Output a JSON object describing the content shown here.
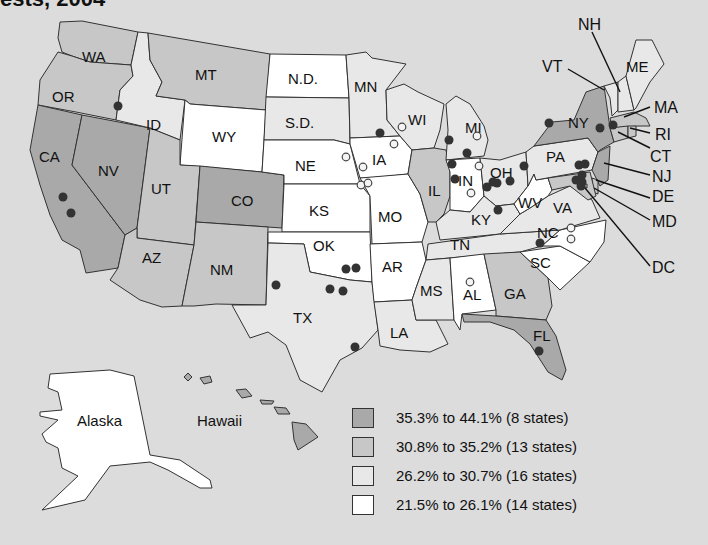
{
  "title": "ests, 2004",
  "colors": {
    "background": "#dcdcdc",
    "bin1": "#a9a9a9",
    "bin2": "#c7c7c7",
    "bin3": "#e8e8e8",
    "bin4": "#ffffff",
    "outline": "#333333"
  },
  "legend": {
    "items": [
      {
        "label": "35.3% to 44.1% (8 states)",
        "bin": "bin1"
      },
      {
        "label": "30.8% to 35.2% (13 states)",
        "bin": "bin2"
      },
      {
        "label": "26.2% to 30.7% (16 states)",
        "bin": "bin3"
      },
      {
        "label": "21.5% to 26.1% (14 states)",
        "bin": "bin4"
      }
    ]
  },
  "inset_labels": {
    "alaska": "Alaska",
    "hawaii": "Hawaii"
  },
  "states": {
    "bin1": [
      "CA",
      "NV",
      "CO",
      "NY",
      "FL",
      "NJ",
      "HI",
      "DC"
    ],
    "bin2": [
      "WA",
      "OR",
      "MT",
      "UT",
      "AZ",
      "NM",
      "IL",
      "GA",
      "MA",
      "CT",
      "RI",
      "MD",
      "DE"
    ],
    "bin3": [
      "ID",
      "S.D.",
      "MN",
      "WI",
      "MI",
      "OH",
      "TX",
      "LA",
      "MS",
      "TN",
      "KY",
      "VA",
      "NH",
      "ME",
      "VT",
      "PA"
    ],
    "bin4": [
      "WY",
      "N.D.",
      "NE",
      "KS",
      "IA",
      "MO",
      "OK",
      "AR",
      "IN",
      "WV",
      "AL",
      "NC",
      "SC",
      "AK"
    ]
  },
  "labels": {
    "WA": "WA",
    "OR": "OR",
    "CA": "CA",
    "NV": "NV",
    "ID": "ID",
    "MT": "MT",
    "WY": "WY",
    "UT": "UT",
    "CO": "CO",
    "AZ": "AZ",
    "NM": "NM",
    "ND": "N.D.",
    "SD": "S.D.",
    "NE": "NE",
    "KS": "KS",
    "OK": "OK",
    "TX": "TX",
    "MN": "MN",
    "IA": "IA",
    "MO": "MO",
    "AR": "AR",
    "LA": "LA",
    "WI": "WI",
    "IL": "IL",
    "MI": "MI",
    "IN": "IN",
    "OH": "OH",
    "KY": "KY",
    "TN": "TN",
    "MS": "MS",
    "AL": "AL",
    "GA": "GA",
    "FL": "FL",
    "SC": "SC",
    "NC": "NC",
    "VA": "VA",
    "WV": "WV",
    "PA": "PA",
    "NY": "NY",
    "VT": "VT",
    "NH": "NH",
    "ME": "ME",
    "MA": "MA",
    "RI": "RI",
    "CT": "CT",
    "NJ": "NJ",
    "DE": "DE",
    "MD": "MD",
    "DC": "DC"
  },
  "markers": {
    "filled": [
      [
        118,
        106
      ],
      [
        63,
        197
      ],
      [
        71,
        213
      ],
      [
        380,
        133
      ],
      [
        346,
        269
      ],
      [
        343,
        291
      ],
      [
        330,
        289
      ],
      [
        356,
        268
      ],
      [
        276,
        285
      ],
      [
        355,
        347
      ],
      [
        449,
        140
      ],
      [
        467,
        153
      ],
      [
        452,
        164
      ],
      [
        455,
        179
      ],
      [
        487,
        187
      ],
      [
        493,
        182
      ],
      [
        497,
        183
      ],
      [
        510,
        181
      ],
      [
        524,
        166
      ],
      [
        498,
        210
      ],
      [
        549,
        123
      ],
      [
        600,
        128
      ],
      [
        613,
        125
      ],
      [
        579,
        165
      ],
      [
        585,
        164
      ],
      [
        576,
        180
      ],
      [
        582,
        182
      ],
      [
        582,
        175
      ],
      [
        581,
        186
      ],
      [
        540,
        243
      ],
      [
        539,
        351
      ]
    ],
    "open": [
      [
        477,
        136
      ],
      [
        479,
        166
      ],
      [
        471,
        193
      ],
      [
        402,
        127
      ],
      [
        394,
        144
      ],
      [
        346,
        157
      ],
      [
        363,
        167
      ],
      [
        361,
        185
      ],
      [
        368,
        183
      ],
      [
        571,
        228
      ],
      [
        571,
        239
      ],
      [
        470,
        282
      ]
    ]
  }
}
